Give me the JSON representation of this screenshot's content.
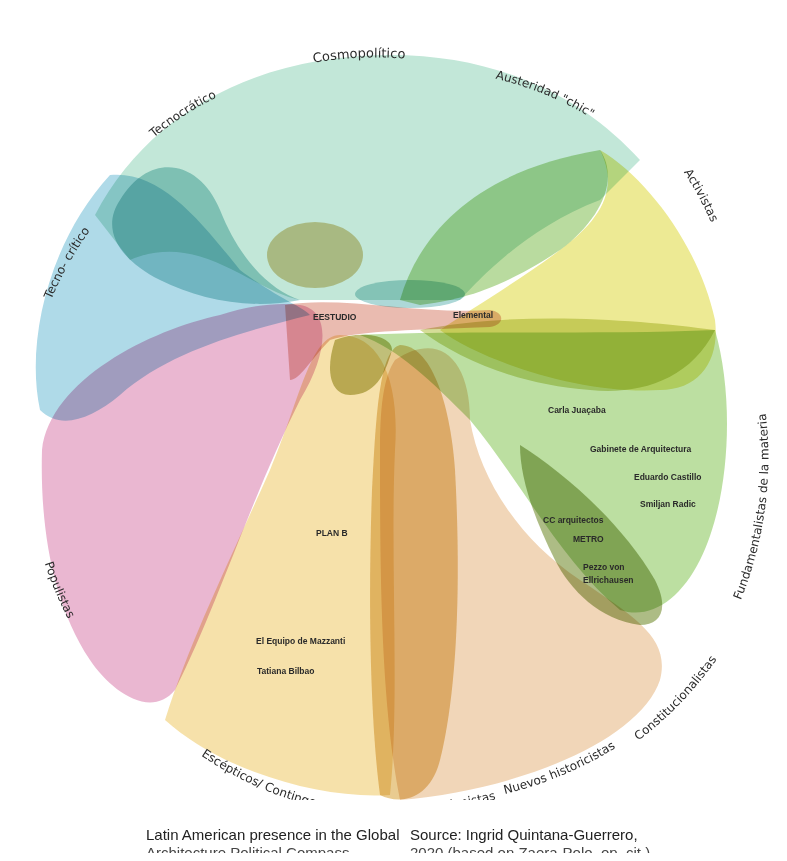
{
  "diagram": {
    "categories": [
      {
        "id": "cosmopolitico",
        "label": "Cosmopolítico",
        "color": "#bfe6d6"
      },
      {
        "id": "austeridad",
        "label": "Austeridad \"chic\"",
        "color": "#b5d99a"
      },
      {
        "id": "activistas",
        "label": "Activistas",
        "color": "#ece98e"
      },
      {
        "id": "tecnocratico",
        "label": "Tecnocrático",
        "color": "#8fc9c9"
      },
      {
        "id": "tecnocritico",
        "label": "Tecno- crítico",
        "color": "#a6d6e6"
      },
      {
        "id": "populistas",
        "label": "Populistas",
        "color": "#e9b3cf"
      },
      {
        "id": "fundamentalistas",
        "label": "Fundamentalistas de la materia",
        "color": "#b9de9c"
      },
      {
        "id": "escepticos",
        "label": "Escépticos/ Contingente",
        "color": "#f6e0a6"
      },
      {
        "id": "revisionistas",
        "label": "Revisionistas",
        "color": "#e8c88a"
      },
      {
        "id": "nuevos",
        "label": "Nuevos historicistas",
        "color": "#f1d4b4"
      },
      {
        "id": "constitucionalistas",
        "label": "Constitucionalistas",
        "color": "#f1d4b4"
      }
    ],
    "architects": [
      {
        "name": "EESTUDIO"
      },
      {
        "name": "Elemental"
      },
      {
        "name": "Carla Juaçaba"
      },
      {
        "name": "Gabinete de Arquitectura"
      },
      {
        "name": "Eduardo Castillo"
      },
      {
        "name": "Smiljan Radic"
      },
      {
        "name": "CC arquitectos"
      },
      {
        "name": "METRO"
      },
      {
        "name": "Pezzo von"
      },
      {
        "name": "Ellrichausen"
      },
      {
        "name": "PLAN B"
      },
      {
        "name": "El Equipo de Mazzanti"
      },
      {
        "name": "Tatiana Bilbao"
      }
    ]
  },
  "caption": {
    "left_line1": "Latin American presence in the Global",
    "left_line2": "Architecture Political Compass",
    "right_line1": "Source: Ingrid Quintana-Guerrero,",
    "right_line2": "2020 (based on Zaera-Polo, op. cit.)"
  }
}
